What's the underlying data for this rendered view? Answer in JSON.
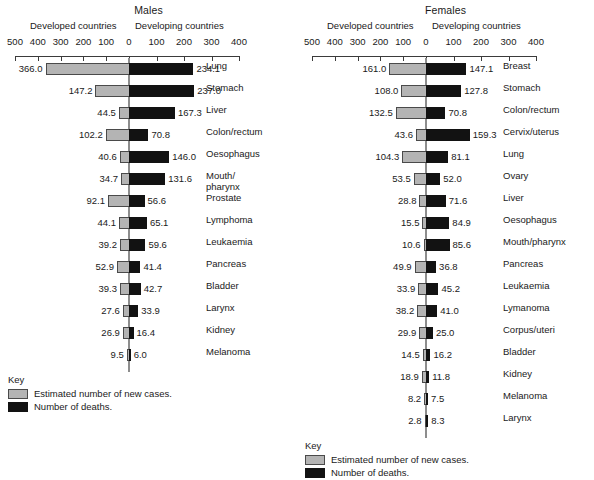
{
  "chart_data": {
    "type": "bar",
    "xlabel": "",
    "ylabel": "",
    "grid": false,
    "legend_position": "bottom-left",
    "axis": {
      "left_ticks": [
        500,
        400,
        300,
        200,
        100,
        0
      ],
      "right_ticks": [
        100,
        200,
        300,
        400
      ],
      "left_max": 500,
      "right_max": 400,
      "tick_labels": [
        "500",
        "400",
        "300",
        "200",
        "100",
        "0",
        "100",
        "200",
        "300",
        "400"
      ]
    },
    "key": {
      "title": "Key",
      "items": [
        {
          "swatch": "cases",
          "label": "Estimated number of new cases."
        },
        {
          "swatch": "deaths",
          "label": "Number of deaths."
        }
      ]
    },
    "panels": [
      {
        "id": "males",
        "title": "Males",
        "left_header": "Developed countries",
        "right_header": "Developing countries",
        "series": [
          {
            "name": "Developed countries (new cases)",
            "side": "left"
          },
          {
            "name": "Developing countries (deaths)",
            "side": "right"
          }
        ],
        "categories": [
          "Lung",
          "Stomach",
          "Liver",
          "Colon/rectum",
          "Oesophagus",
          "Mouth/\npharynx",
          "Prostate",
          "Lymphoma",
          "Leukaemia",
          "Pancreas",
          "Bladder",
          "Larynx",
          "Kidney",
          "Melanoma"
        ],
        "rows": [
          {
            "label": "Lung",
            "left": 366.0,
            "right": 234.1,
            "left_text": "366.0",
            "right_text": "234.1"
          },
          {
            "label": "Stomach",
            "left": 147.2,
            "right": 237.0,
            "left_text": "147.2",
            "right_text": "237.0"
          },
          {
            "label": "Liver",
            "left": 44.5,
            "right": 167.3,
            "left_text": "44.5",
            "right_text": "167.3"
          },
          {
            "label": "Colon/rectum",
            "left": 102.2,
            "right": 70.8,
            "left_text": "102.2",
            "right_text": "70.8"
          },
          {
            "label": "Oesophagus",
            "left": 40.6,
            "right": 146.0,
            "left_text": "40.6",
            "right_text": "146.0"
          },
          {
            "label": "Mouth/\npharynx",
            "left": 34.7,
            "right": 131.6,
            "left_text": "34.7",
            "right_text": "131.6"
          },
          {
            "label": "Prostate",
            "left": 92.1,
            "right": 56.6,
            "left_text": "92.1",
            "right_text": "56.6"
          },
          {
            "label": "Lymphoma",
            "left": 44.1,
            "right": 65.1,
            "left_text": "44.1",
            "right_text": "65.1"
          },
          {
            "label": "Leukaemia",
            "left": 39.2,
            "right": 59.6,
            "left_text": "39.2",
            "right_text": "59.6"
          },
          {
            "label": "Pancreas",
            "left": 52.9,
            "right": 41.4,
            "left_text": "52.9",
            "right_text": "41.4"
          },
          {
            "label": "Bladder",
            "left": 39.3,
            "right": 42.7,
            "left_text": "39.3",
            "right_text": "42.7"
          },
          {
            "label": "Larynx",
            "left": 27.6,
            "right": 33.9,
            "left_text": "27.6",
            "right_text": "33.9"
          },
          {
            "label": "Kidney",
            "left": 26.9,
            "right": 16.4,
            "left_text": "26.9",
            "right_text": "16.4"
          },
          {
            "label": "Melanoma",
            "left": 9.5,
            "right": 6.0,
            "left_text": "9.5",
            "right_text": "6.0"
          }
        ]
      },
      {
        "id": "females",
        "title": "Females",
        "left_header": "Developed countries",
        "right_header": "Developing countries",
        "series": [
          {
            "name": "Developed countries (new cases)",
            "side": "left"
          },
          {
            "name": "Developing countries (deaths)",
            "side": "right"
          }
        ],
        "categories": [
          "Breast",
          "Stomach",
          "Colon/rectum",
          "Cervix/uterus",
          "Lung",
          "Ovary",
          "Liver",
          "Oesophagus",
          "Mouth/pharynx",
          "Pancreas",
          "Leukaemia",
          "Lymanoma",
          "Corpus/uteri",
          "Bladder",
          "Kidney",
          "Melanoma",
          "Larynx"
        ],
        "rows": [
          {
            "label": "Breast",
            "left": 161.0,
            "right": 147.1,
            "left_text": "161.0",
            "right_text": "147.1"
          },
          {
            "label": "Stomach",
            "left": 108.0,
            "right": 127.8,
            "left_text": "108.0",
            "right_text": "127.8"
          },
          {
            "label": "Colon/rectum",
            "left": 132.5,
            "right": 70.8,
            "left_text": "132.5",
            "right_text": "70.8"
          },
          {
            "label": "Cervix/uterus",
            "left": 43.6,
            "right": 159.3,
            "left_text": "43.6",
            "right_text": "159.3"
          },
          {
            "label": "Lung",
            "left": 104.3,
            "right": 81.1,
            "left_text": "104.3",
            "right_text": "81.1"
          },
          {
            "label": "Ovary",
            "left": 53.5,
            "right": 52.0,
            "left_text": "53.5",
            "right_text": "52.0"
          },
          {
            "label": "Liver",
            "left": 28.8,
            "right": 71.6,
            "left_text": "28.8",
            "right_text": "71.6"
          },
          {
            "label": "Oesophagus",
            "left": 15.5,
            "right": 84.9,
            "left_text": "15.5",
            "right_text": "84.9"
          },
          {
            "label": "Mouth/pharynx",
            "left": 10.6,
            "right": 85.6,
            "left_text": "10.6",
            "right_text": "85.6"
          },
          {
            "label": "Pancreas",
            "left": 49.9,
            "right": 36.8,
            "left_text": "49.9",
            "right_text": "36.8"
          },
          {
            "label": "Leukaemia",
            "left": 33.9,
            "right": 45.2,
            "left_text": "33.9",
            "right_text": "45.2"
          },
          {
            "label": "Lymanoma",
            "left": 38.2,
            "right": 41.0,
            "left_text": "38.2",
            "right_text": "41.0"
          },
          {
            "label": "Corpus/uteri",
            "left": 29.9,
            "right": 25.0,
            "left_text": "29.9",
            "right_text": "25.0"
          },
          {
            "label": "Bladder",
            "left": 14.5,
            "right": 16.2,
            "left_text": "14.5",
            "right_text": "16.2"
          },
          {
            "label": "Kidney",
            "left": 18.9,
            "right": 11.8,
            "left_text": "18.9",
            "right_text": "11.8"
          },
          {
            "label": "Melanoma",
            "left": 8.2,
            "right": 7.5,
            "left_text": "8.2",
            "right_text": "7.5"
          },
          {
            "label": "Larynx",
            "left": 2.8,
            "right": 8.3,
            "left_text": "2.8",
            "right_text": "8.3"
          }
        ]
      }
    ]
  }
}
